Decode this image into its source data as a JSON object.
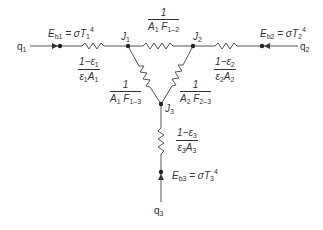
{
  "diagram": {
    "type": "radiation-network",
    "nodes": {
      "Eb1": {
        "label_html": "E<sub>b1</sub> = σT<sub>1</sub><sup>4</sup>"
      },
      "Eb2": {
        "label_html": "E<sub>b2</sub> = σT<sub>2</sub><sup>4</sup>"
      },
      "Eb3": {
        "label_html": "E<sub>b3</sub> = σT<sub>3</sub><sup>4</sup>"
      },
      "J1": {
        "label_html": "J<sub>1</sub>"
      },
      "J2": {
        "label_html": "J<sub>2</sub>"
      },
      "J3": {
        "label_html": "J<sub>3</sub>"
      }
    },
    "flows": {
      "q1": {
        "label_html": "q<sub>1</sub>"
      },
      "q2": {
        "label_html": "q<sub>2</sub>"
      },
      "q3": {
        "label_html": "q<sub>3</sub>"
      }
    },
    "resistances": {
      "surface1": {
        "num": "1−ε<sub>1</sub>",
        "den": "ε<sub>1</sub>A<sub>1</sub>"
      },
      "surface2": {
        "num": "1−ε<sub>2</sub>",
        "den": "ε<sub>2</sub>A<sub>2</sub>"
      },
      "surface3": {
        "num": "1−ε<sub>3</sub>",
        "den": "ε<sub>3</sub>A<sub>3</sub>"
      },
      "space12": {
        "num": "1",
        "den": "A<sub>1</sub> F<sub>1–2</sub>"
      },
      "space13": {
        "num": "1",
        "den": "A<sub>1</sub> F<sub>1–3</sub>"
      },
      "space23": {
        "num": "1",
        "den": "A<sub>2</sub> F<sub>2–3</sub>"
      }
    },
    "colors": {
      "line": "#555555",
      "text": "#333333"
    }
  }
}
